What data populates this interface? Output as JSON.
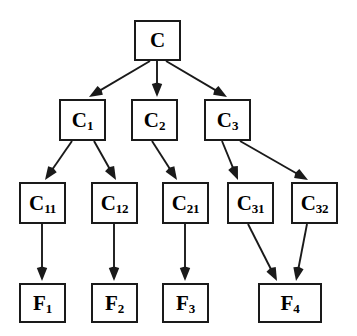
{
  "diagram": {
    "type": "tree-diagram",
    "background_color": "#ffffff",
    "node_fill_color": "#ffffff",
    "node_border_color": "#1a1a1a",
    "edge_color": "#1a1a1a",
    "levels": 4,
    "nodes": [
      {
        "id": "C",
        "base": "C",
        "sub": "",
        "level": 0,
        "x": 134,
        "y": 20,
        "w": 47,
        "h": 41
      },
      {
        "id": "C1",
        "base": "C",
        "sub": "1",
        "level": 1,
        "x": 59,
        "y": 99,
        "w": 47,
        "h": 42
      },
      {
        "id": "C2",
        "base": "C",
        "sub": "2",
        "level": 1,
        "x": 131,
        "y": 99,
        "w": 47,
        "h": 42
      },
      {
        "id": "C3",
        "base": "C",
        "sub": "3",
        "level": 1,
        "x": 204,
        "y": 99,
        "w": 47,
        "h": 42
      },
      {
        "id": "C11",
        "base": "C",
        "sub": "11",
        "level": 2,
        "x": 19,
        "y": 182,
        "w": 47,
        "h": 42
      },
      {
        "id": "C12",
        "base": "C",
        "sub": "12",
        "level": 2,
        "x": 91,
        "y": 182,
        "w": 47,
        "h": 42
      },
      {
        "id": "C21",
        "base": "C",
        "sub": "21",
        "level": 2,
        "x": 162,
        "y": 182,
        "w": 47,
        "h": 42
      },
      {
        "id": "C31",
        "base": "C",
        "sub": "31",
        "level": 2,
        "x": 227,
        "y": 182,
        "w": 47,
        "h": 42
      },
      {
        "id": "C32",
        "base": "C",
        "sub": "32",
        "level": 2,
        "x": 291,
        "y": 182,
        "w": 47,
        "h": 42
      },
      {
        "id": "F1",
        "base": "F",
        "sub": "1",
        "level": 3,
        "x": 19,
        "y": 283,
        "w": 47,
        "h": 40
      },
      {
        "id": "F2",
        "base": "F",
        "sub": "2",
        "level": 3,
        "x": 91,
        "y": 283,
        "w": 47,
        "h": 40
      },
      {
        "id": "F3",
        "base": "F",
        "sub": "3",
        "level": 3,
        "x": 162,
        "y": 283,
        "w": 47,
        "h": 40
      },
      {
        "id": "F4",
        "base": "F",
        "sub": "4",
        "level": 3,
        "x": 258,
        "y": 283,
        "w": 64,
        "h": 40
      }
    ],
    "edges": [
      {
        "from": "C",
        "to": "C1",
        "x1": 150,
        "y1": 61,
        "x2": 89,
        "y2": 97
      },
      {
        "from": "C",
        "to": "C2",
        "x1": 157,
        "y1": 61,
        "x2": 157,
        "y2": 97
      },
      {
        "from": "C",
        "to": "C3",
        "x1": 166,
        "y1": 61,
        "x2": 227,
        "y2": 97
      },
      {
        "from": "C1",
        "to": "C11",
        "x1": 72,
        "y1": 141,
        "x2": 45,
        "y2": 180
      },
      {
        "from": "C1",
        "to": "C12",
        "x1": 94,
        "y1": 141,
        "x2": 116,
        "y2": 180
      },
      {
        "from": "C2",
        "to": "C21",
        "x1": 152,
        "y1": 141,
        "x2": 177,
        "y2": 180
      },
      {
        "from": "C3",
        "to": "C31",
        "x1": 222,
        "y1": 141,
        "x2": 238,
        "y2": 180
      },
      {
        "from": "C3",
        "to": "C32",
        "x1": 240,
        "y1": 141,
        "x2": 308,
        "y2": 180
      },
      {
        "from": "C11",
        "to": "F1",
        "x1": 42,
        "y1": 224,
        "x2": 42,
        "y2": 281
      },
      {
        "from": "C12",
        "to": "F2",
        "x1": 114,
        "y1": 224,
        "x2": 114,
        "y2": 281
      },
      {
        "from": "C21",
        "to": "F3",
        "x1": 185,
        "y1": 224,
        "x2": 185,
        "y2": 281
      },
      {
        "from": "C31",
        "to": "F4",
        "x1": 248,
        "y1": 224,
        "x2": 277,
        "y2": 281
      },
      {
        "from": "C32",
        "to": "F4",
        "x1": 307,
        "y1": 224,
        "x2": 296,
        "y2": 281
      }
    ]
  }
}
